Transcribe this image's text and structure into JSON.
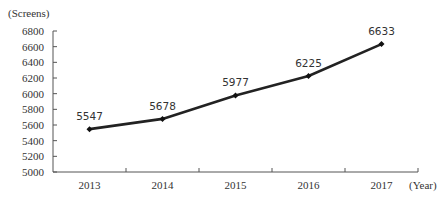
{
  "chart_data": {
    "type": "line",
    "title": "",
    "xlabel": "(Year)",
    "ylabel": "(Screens)",
    "categories": [
      "2013",
      "2014",
      "2015",
      "2016",
      "2017"
    ],
    "series": [
      {
        "name": "Screens",
        "values": [
          5547,
          5678,
          5977,
          6225,
          6633
        ],
        "color": "#222222"
      }
    ],
    "ylim": [
      5000,
      6800
    ],
    "yticks": [
      "6800",
      "6600",
      "6400",
      "6200",
      "6000",
      "5800",
      "5600",
      "5400",
      "5200",
      "5000"
    ],
    "grid": false,
    "legend": "none",
    "data_labels": [
      "5547",
      "5678",
      "5977",
      "6225",
      "6633"
    ]
  }
}
